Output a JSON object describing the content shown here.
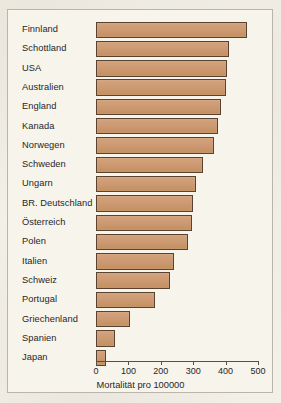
{
  "chart_data": {
    "type": "bar",
    "orientation": "horizontal",
    "title": "",
    "subtitle": "",
    "xlabel": "Mortalität pro 100000",
    "ylabel": "",
    "xlim": [
      0,
      520
    ],
    "xticks": [
      0,
      100,
      200,
      300,
      400,
      500
    ],
    "xtick_labels": [
      "0",
      "100",
      "200",
      "300",
      "400",
      "500"
    ],
    "grid": false,
    "legend": null,
    "bar_color": "#cb9871",
    "bar_edge_color": "#5a4230",
    "background_color": "#f7f4ec",
    "frame_color": "#b9b5ab",
    "categories": [
      "Finnland",
      "Schottland",
      "USA",
      "Australien",
      "England",
      "Kanada",
      "Norwegen",
      "Schweden",
      "Ungarn",
      "BR. Deutschland",
      "Österreich",
      "Polen",
      "Italien",
      "Schweiz",
      "Portugal",
      "Griechenland",
      "Spanien",
      "Japan"
    ],
    "values": [
      465,
      410,
      405,
      400,
      385,
      375,
      365,
      330,
      310,
      300,
      295,
      285,
      240,
      228,
      182,
      106,
      60,
      30
    ]
  },
  "axis": {
    "x_title": "Mortalität pro 100000"
  }
}
